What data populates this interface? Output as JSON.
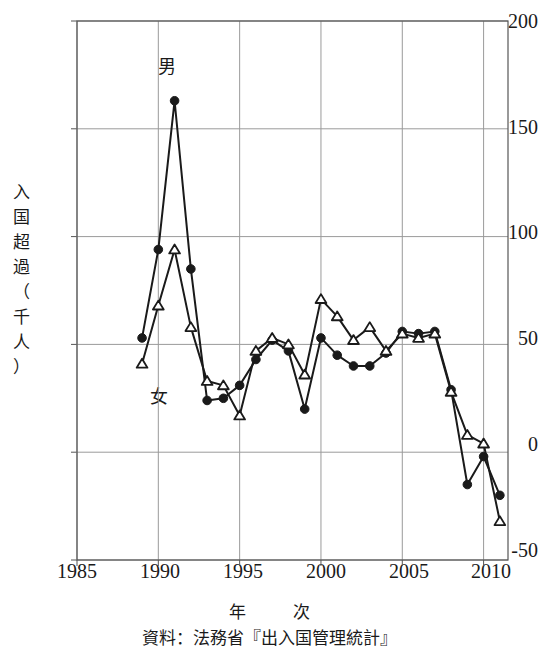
{
  "chart_data": {
    "type": "line",
    "title": "",
    "xlabel": "年　　次",
    "ylabel": "入国超過（千人）",
    "xlim": [
      1985,
      2011.5
    ],
    "ylim": [
      -50,
      200
    ],
    "xticks": [
      1985,
      1990,
      1995,
      2000,
      2005,
      2010
    ],
    "yticks": [
      -50,
      0,
      50,
      100,
      150,
      200
    ],
    "grid": true,
    "legend_position": "inline-annotation",
    "x": [
      1989,
      1990,
      1991,
      1992,
      1993,
      1994,
      1995,
      1996,
      1997,
      1998,
      1999,
      2000,
      2001,
      2002,
      2003,
      2004,
      2005,
      2006,
      2007,
      2008,
      2009,
      2010,
      2011
    ],
    "series": [
      {
        "name": "男",
        "marker": "filled-circle",
        "values": [
          53,
          94,
          163,
          85,
          24,
          25,
          31,
          43,
          52,
          47,
          20,
          53,
          45,
          40,
          40,
          46,
          56,
          55,
          56,
          29,
          -15,
          -2,
          -20
        ]
      },
      {
        "name": "女",
        "marker": "open-triangle",
        "values": [
          41,
          68,
          94,
          58,
          33,
          31,
          17,
          47,
          53,
          50,
          36,
          71,
          63,
          52,
          58,
          47,
          55,
          53,
          55,
          28,
          8,
          4,
          -32
        ]
      }
    ],
    "annotations": [
      {
        "text": "男",
        "x": 1990.2,
        "y": 178
      },
      {
        "text": "女",
        "x": 1990.0,
        "y": 27
      }
    ],
    "source_note": "資料：法務省『出入国管理統計』"
  },
  "labels": {
    "ylabel_chars": [
      "入",
      "国",
      "超",
      "過",
      "（",
      "千",
      "人",
      "）"
    ],
    "xlabel_left": "年",
    "xlabel_right": "次",
    "caption": "資料：法務省『出入国管理統計』",
    "ytick_texts": [
      "200",
      "150",
      "100",
      "50",
      "0",
      "-50"
    ],
    "xtick_texts": [
      "1985",
      "1990",
      "1995",
      "2000",
      "2005",
      "2010"
    ],
    "male_label": "男",
    "female_label": "女"
  },
  "colors": {
    "ink": "#1a1a1a",
    "grid": "#9a9a9a",
    "axis": "#555555",
    "background": "#ffffff"
  }
}
